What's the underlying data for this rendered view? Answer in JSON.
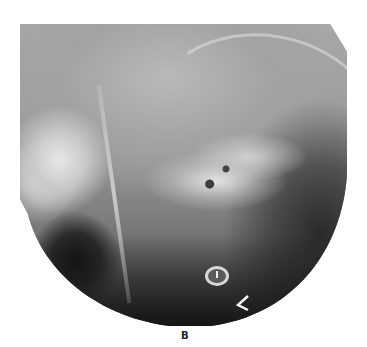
{
  "figure": {
    "panel_label": "B",
    "image_type": "lateral skull radiograph",
    "annotation_marker": "arrowhead pointing left",
    "colors": {
      "background": "#ffffff",
      "bone_highlight": "#e2e2e2",
      "soft_tissue": "#9a9a9a",
      "air_dark": "#1a1a1a",
      "caption": "#222222"
    }
  }
}
